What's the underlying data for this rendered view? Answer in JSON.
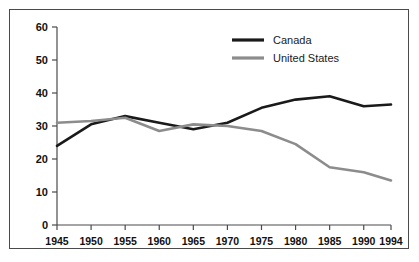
{
  "chart_data": {
    "type": "line",
    "title": "",
    "subtitle": "",
    "xlabel": "",
    "ylabel": "",
    "x": [
      1945,
      1950,
      1955,
      1960,
      1965,
      1970,
      1975,
      1980,
      1985,
      1990,
      1994
    ],
    "categories": [
      "1945",
      "1950",
      "1955",
      "1960",
      "1965",
      "1970",
      "1975",
      "1980",
      "1985",
      "1990",
      "1994"
    ],
    "xlim": [
      1945,
      1994
    ],
    "ylim": [
      0,
      60
    ],
    "yticks": [
      0,
      10,
      20,
      30,
      40,
      50,
      60
    ],
    "ytick_labels": [
      "0",
      "10",
      "20",
      "30",
      "40",
      "50",
      "60"
    ],
    "grid": false,
    "legend_position": "top-right",
    "series": [
      {
        "name": "Canada",
        "color": "#1a1a1a",
        "values": [
          24,
          30.5,
          33,
          31,
          29,
          31,
          35.5,
          38,
          39,
          36,
          36.5
        ]
      },
      {
        "name": "United States",
        "color": "#8c8c8c",
        "values": [
          31,
          31.5,
          32.5,
          28.5,
          30.5,
          30,
          28.5,
          24.5,
          17.5,
          16,
          13.5
        ]
      }
    ]
  },
  "legend": {
    "entries": [
      {
        "label": "Canada"
      },
      {
        "label": "United States"
      }
    ]
  },
  "caption": {
    "text": ""
  },
  "colors": {
    "canada": "#1a1a1a",
    "united_states": "#8c8c8c",
    "axis": "#4a4a4a",
    "frame": "#4a4a4a",
    "text": "#111111"
  }
}
